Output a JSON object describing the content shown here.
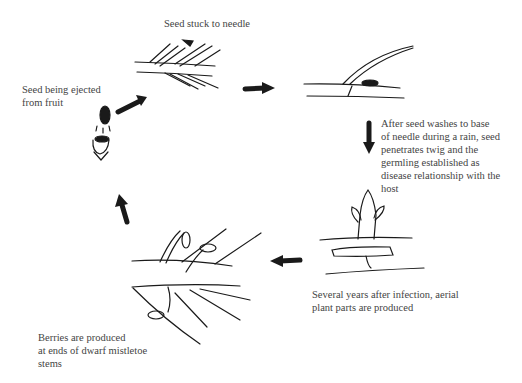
{
  "diagram": {
    "type": "life-cycle",
    "stages": [
      {
        "id": "seed-ejected",
        "label": "Seed being ejected\nfrom fruit"
      },
      {
        "id": "seed-stuck",
        "label": "Seed stuck to needle"
      },
      {
        "id": "seed-washes",
        "label": "After seed washes to base\nof needle during a rain, seed\npenetrates twig and the\ngermling established as\ndisease relationship with the\nhost"
      },
      {
        "id": "aerial-parts",
        "label": "Several years after infection, aerial\nplant parts are produced"
      },
      {
        "id": "berries",
        "label": "Berries are produced\nat ends of dwarf mistletoe\nstems"
      }
    ],
    "arrows": [
      {
        "from": "seed-ejected",
        "to": "seed-stuck",
        "direction": "up-right"
      },
      {
        "from": "seed-stuck",
        "to": "seed-washes",
        "direction": "right"
      },
      {
        "from": "seed-washes",
        "to": "aerial-parts",
        "direction": "down"
      },
      {
        "from": "aerial-parts",
        "to": "berries",
        "direction": "left"
      },
      {
        "from": "berries",
        "to": "seed-ejected",
        "direction": "up"
      }
    ],
    "ink_color": "#1a1a1a"
  }
}
